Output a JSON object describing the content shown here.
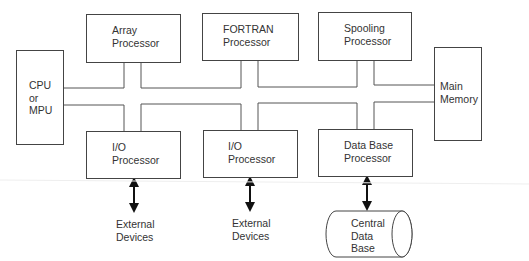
{
  "diagram": {
    "type": "block-diagram",
    "nodes": [
      {
        "id": "cpu",
        "lines": [
          "CPU",
          "or",
          "MPU"
        ]
      },
      {
        "id": "array",
        "lines": [
          "Array",
          "Processor"
        ]
      },
      {
        "id": "fortran",
        "lines": [
          "FORTRAN",
          "Processor"
        ]
      },
      {
        "id": "spooling",
        "lines": [
          "Spooling",
          "Processor"
        ]
      },
      {
        "id": "memory",
        "lines": [
          "Main",
          "Memory"
        ]
      },
      {
        "id": "io1",
        "lines": [
          "I/O",
          "Processor"
        ]
      },
      {
        "id": "io2",
        "lines": [
          "I/O",
          "Processor"
        ]
      },
      {
        "id": "dbp",
        "lines": [
          "Data Base",
          "Processor"
        ]
      },
      {
        "id": "ext1",
        "lines": [
          "External",
          "Devices"
        ]
      },
      {
        "id": "ext2",
        "lines": [
          "External",
          "Devices"
        ]
      },
      {
        "id": "cdb",
        "lines": [
          "Central",
          "Data",
          "Base"
        ]
      }
    ],
    "edges": [
      {
        "from": "cpu",
        "to": "bus",
        "kind": "bus"
      },
      {
        "from": "array",
        "to": "bus",
        "kind": "bus"
      },
      {
        "from": "fortran",
        "to": "bus",
        "kind": "bus"
      },
      {
        "from": "spooling",
        "to": "bus",
        "kind": "bus"
      },
      {
        "from": "memory",
        "to": "bus",
        "kind": "bus"
      },
      {
        "from": "io1",
        "to": "bus",
        "kind": "bus"
      },
      {
        "from": "io2",
        "to": "bus",
        "kind": "bus"
      },
      {
        "from": "dbp",
        "to": "bus",
        "kind": "bus"
      },
      {
        "from": "io1",
        "to": "ext1",
        "kind": "bidirectional-arrow"
      },
      {
        "from": "io2",
        "to": "ext2",
        "kind": "bidirectional-arrow"
      },
      {
        "from": "dbp",
        "to": "cdb",
        "kind": "bidirectional-arrow"
      }
    ]
  }
}
